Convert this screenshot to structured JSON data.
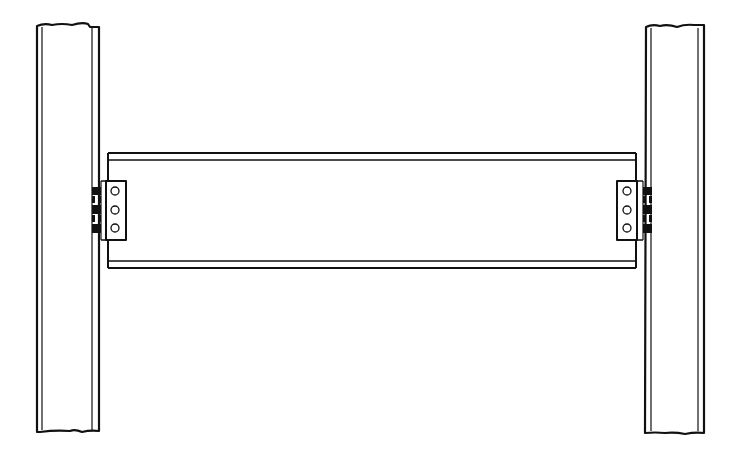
{
  "diagram": {
    "title": "",
    "colors": {
      "background": "#ffffff",
      "line": "#111111",
      "fill_bolt": "#111111"
    },
    "components": [
      {
        "id": "left-column",
        "type": "column",
        "x": 36,
        "y": 24,
        "width": 63,
        "height": 408
      },
      {
        "id": "right-column",
        "type": "column",
        "x": 645,
        "y": 25,
        "width": 60,
        "height": 408
      },
      {
        "id": "beam",
        "type": "beam",
        "x": 106,
        "y": 152,
        "width": 530,
        "height": 116
      },
      {
        "id": "left-clip-angle",
        "type": "connection",
        "bolts": 3
      },
      {
        "id": "right-clip-angle",
        "type": "connection",
        "bolts": 3
      }
    ],
    "labels": []
  }
}
